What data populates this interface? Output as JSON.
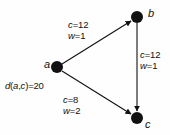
{
  "figure": {
    "type": "directed-graph",
    "background_color": "#fefefe",
    "stroke_color": "#111111",
    "node_fill": "#111111"
  },
  "nodes": [
    {
      "id": "a",
      "label": "a",
      "x": 57,
      "y": 67,
      "r": 6
    },
    {
      "id": "b",
      "label": "b",
      "x": 137,
      "y": 17,
      "r": 6
    },
    {
      "id": "c",
      "label": "c",
      "x": 137,
      "y": 118,
      "r": 6
    }
  ],
  "edges": [
    {
      "id": "a-b",
      "from": "a",
      "to": "b",
      "capacity_label": "c=12",
      "weight_label": "w=1",
      "capacity": 12,
      "weight": 1
    },
    {
      "id": "b-c",
      "from": "b",
      "to": "c",
      "capacity_label": "c=12",
      "weight_label": "w=1",
      "capacity": 12,
      "weight": 1
    },
    {
      "id": "a-c",
      "from": "a",
      "to": "c",
      "capacity_label": "c=8",
      "weight_label": "w=2",
      "capacity": 8,
      "weight": 2
    }
  ],
  "annotations": {
    "distance_label": "d(a,c)=20",
    "distance_value": 20
  }
}
